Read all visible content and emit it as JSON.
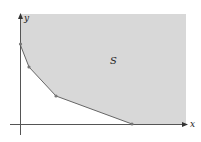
{
  "figure": {
    "region_label": "S",
    "x_axis_label": "x",
    "y_axis_label": "y",
    "region_fill": "#d8d8d8",
    "axis_color": "#555555",
    "boundary_color": "#666666",
    "vertices": [
      {
        "x": 20,
        "y": 44
      },
      {
        "x": 29,
        "y": 67
      },
      {
        "x": 56,
        "y": 96
      },
      {
        "x": 132,
        "y": 124
      }
    ]
  }
}
